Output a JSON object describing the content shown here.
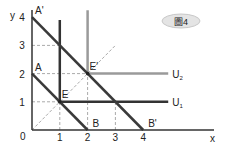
{
  "figure_label": "圖4",
  "axes": {
    "x_label": "x",
    "y_label": "y",
    "origin_label": "0",
    "x_ticks": [
      "1",
      "2",
      "3",
      "4"
    ],
    "y_ticks": [
      "1",
      "2",
      "3",
      "4"
    ],
    "x_range": [
      0,
      6.5
    ],
    "y_range": [
      0,
      4.3
    ]
  },
  "budget_lines": [
    {
      "name": "AB",
      "start": [
        0,
        2
      ],
      "end": [
        2,
        0
      ],
      "start_label": "A",
      "end_label": "B"
    },
    {
      "name": "A'B'",
      "start": [
        0,
        4
      ],
      "end": [
        4,
        0
      ],
      "start_label": "A'",
      "end_label": "B'"
    }
  ],
  "indifference_curves": [
    {
      "label": "U₁",
      "label_base": "U",
      "label_sub": "1",
      "corner": [
        1,
        1
      ],
      "color": "#333333"
    },
    {
      "label": "U₂",
      "label_base": "U",
      "label_sub": "2",
      "corner": [
        2,
        2
      ],
      "color": "#9a9a9a"
    }
  ],
  "points": [
    {
      "label": "E",
      "at": [
        1,
        1
      ]
    },
    {
      "label": "E'",
      "at": [
        2,
        2
      ]
    }
  ],
  "dashed_guides": {
    "horizontal": [
      [
        3,
        1
      ],
      [
        2,
        2
      ],
      [
        1,
        3
      ]
    ],
    "vertical": [
      [
        1,
        1
      ],
      [
        2,
        2
      ],
      [
        3,
        1
      ]
    ],
    "diagonal_end": [
      3,
      3
    ]
  },
  "colors": {
    "axis": "#333333",
    "budget": "#3a3a3a",
    "dash": "#aaaaaa",
    "ellipse_fill": "#e4e4e4",
    "ellipse_stroke": "#c8c8c8"
  }
}
